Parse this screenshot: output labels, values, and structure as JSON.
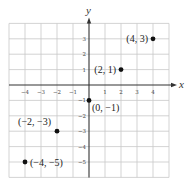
{
  "chart_data": {
    "type": "scatter",
    "title": "",
    "xlabel": "x",
    "ylabel": "y",
    "xlim": [
      -5,
      5
    ],
    "ylim": [
      -6,
      4
    ],
    "grid": true,
    "x_ticks": [
      -4,
      -3,
      -2,
      -1,
      1,
      2,
      3,
      4
    ],
    "y_ticks": [
      -5,
      -4,
      -3,
      -2,
      -1,
      1,
      2,
      3
    ],
    "x_tick_labels": [
      "−4",
      "−3",
      "−2",
      "−1",
      "1",
      "2",
      "3",
      "4"
    ],
    "y_tick_labels": [
      "−5",
      "−4",
      "−3",
      "−2",
      "−1",
      "1",
      "2",
      "3"
    ],
    "points": [
      {
        "x": 4,
        "y": 3,
        "label": "(4, 3)",
        "label_side": "left"
      },
      {
        "x": 2,
        "y": 1,
        "label": "(2, 1)",
        "label_side": "left"
      },
      {
        "x": 0,
        "y": -1,
        "label": "(0, −1)",
        "label_side": "below-right"
      },
      {
        "x": -2,
        "y": -3,
        "label": "(−2, −3)",
        "label_side": "above-left"
      },
      {
        "x": -4,
        "y": -5,
        "label": "(−4, −5)",
        "label_side": "right"
      }
    ]
  }
}
